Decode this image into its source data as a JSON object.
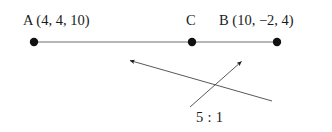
{
  "figure": {
    "type": "geometry-line-segment-ratio-diagram",
    "background_color": "#ffffff",
    "ink_color": "#1a1a1a",
    "line_color": "#555555",
    "labels": {
      "point_a": "A (4, 4, 10)",
      "point_c": "C",
      "point_b": "B (10, −2, 4)",
      "ratio": "5 : 1"
    },
    "points": [
      {
        "name": "A",
        "x": 34,
        "y": 42,
        "coordinates": [
          4,
          4,
          10
        ]
      },
      {
        "name": "C",
        "x": 192,
        "y": 42,
        "coordinates": null
      },
      {
        "name": "B",
        "x": 277,
        "y": 42,
        "coordinates": [
          10,
          -2,
          4
        ]
      }
    ],
    "segment": {
      "x1": 34,
      "y1": 42,
      "x2": 277,
      "y2": 42
    },
    "ratio_arrows": [
      {
        "name": "arrow-to-left",
        "x1": 272,
        "y1": 101,
        "x2": 128,
        "y2": 60
      },
      {
        "name": "arrow-to-right",
        "x1": 190,
        "y1": 107,
        "x2": 243,
        "y2": 60
      }
    ]
  }
}
